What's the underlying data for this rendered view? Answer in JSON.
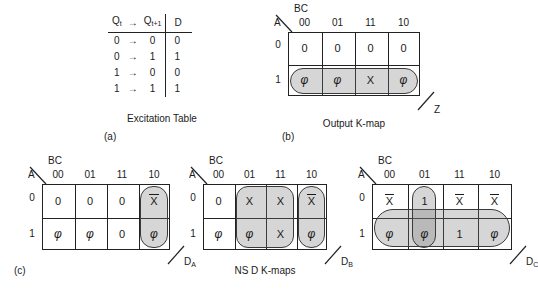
{
  "figure": {
    "excitation_table": {
      "headers": [
        "Q",
        "t",
        "→",
        "Q",
        "t+1",
        "D"
      ],
      "header_q_t": "Q",
      "header_q_t_sub": "t",
      "header_arrow": "→",
      "header_q_next": "Q",
      "header_q_next_sub": "t+1",
      "header_d": "D",
      "rows": [
        {
          "from": "0",
          "arrow": "→",
          "to": "0",
          "d": "0"
        },
        {
          "from": "0",
          "arrow": "→",
          "to": "1",
          "d": "1"
        },
        {
          "from": "1",
          "arrow": "→",
          "to": "0",
          "d": "0"
        },
        {
          "from": "1",
          "arrow": "→",
          "to": "1",
          "d": "1"
        }
      ],
      "caption": "Excitation Table",
      "label": "(a)"
    },
    "output_kmap": {
      "bc_label": "BC",
      "a_label": "A",
      "col_headers": [
        "00",
        "01",
        "11",
        "10"
      ],
      "row_headers": [
        "0",
        "1"
      ],
      "cells": [
        [
          "0",
          "0",
          "0",
          "0"
        ],
        [
          "φ",
          "φ",
          "X",
          "φ"
        ]
      ],
      "output_name": "Z",
      "caption": "Output K-map",
      "label": "(b)"
    },
    "da_kmap": {
      "bc_label": "BC",
      "a_label": "A",
      "col_headers": [
        "00",
        "01",
        "11",
        "10"
      ],
      "row_headers": [
        "0",
        "1"
      ],
      "cells": [
        [
          "0",
          "0",
          "0",
          "X"
        ],
        [
          "φ",
          "φ",
          "0",
          "φ"
        ]
      ],
      "overbar_cells": [
        "r0c3"
      ],
      "output_name": "D",
      "output_sub": "A",
      "label": "(c)"
    },
    "db_kmap": {
      "bc_label": "BC",
      "a_label": "A",
      "col_headers": [
        "00",
        "01",
        "11",
        "10"
      ],
      "row_headers": [
        "0",
        "1"
      ],
      "cells": [
        [
          "0",
          "X",
          "X",
          "X"
        ],
        [
          "φ",
          "φ",
          "X",
          "φ"
        ]
      ],
      "overbar_cells": [
        "r0c3"
      ],
      "output_name": "D",
      "output_sub": "B"
    },
    "dc_kmap": {
      "bc_label": "BC",
      "a_label": "A",
      "col_headers": [
        "00",
        "01",
        "11",
        "10"
      ],
      "row_headers": [
        "0",
        "1"
      ],
      "cells": [
        [
          "X",
          "1",
          "X",
          "X"
        ],
        [
          "φ",
          "φ",
          "1",
          "φ"
        ]
      ],
      "overbar_cells": [
        "r0c0",
        "r0c2",
        "r0c3"
      ],
      "output_name": "D",
      "output_sub": "C"
    },
    "bottom_caption": "NS D K-maps"
  }
}
